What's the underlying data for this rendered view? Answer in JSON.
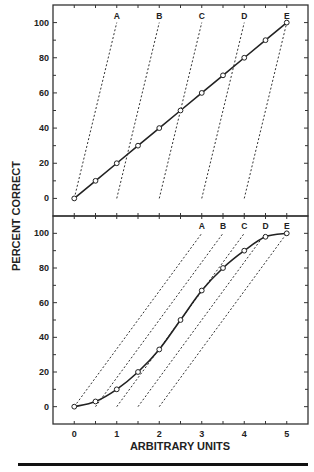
{
  "chart_data": [
    {
      "type": "line",
      "panel": "top",
      "title": "",
      "xlabel": "ARBITRARY UNITS",
      "ylabel": "PERCENT CORRECT",
      "xlim": [
        -0.5,
        5.5
      ],
      "ylim": [
        -10,
        110
      ],
      "x_ticks": [
        0,
        0.5,
        1,
        1.5,
        2,
        2.5,
        3,
        3.5,
        4,
        4.5,
        5
      ],
      "y_ticks": [
        0,
        20,
        40,
        60,
        80,
        100
      ],
      "y_tick_labels": [
        "0",
        "20",
        "40",
        "60",
        "80",
        "100"
      ],
      "grid": false,
      "series": [
        {
          "name": "observed",
          "style": "solid-with-circles",
          "x": [
            0,
            0.5,
            1,
            1.5,
            2,
            2.5,
            3,
            3.5,
            4,
            4.5,
            5
          ],
          "y": [
            0,
            10,
            20,
            30,
            40,
            50,
            60,
            70,
            80,
            90,
            100
          ]
        }
      ],
      "dashed_lines": [
        {
          "label": "A",
          "from": [
            0,
            0
          ],
          "to": [
            1,
            100
          ]
        },
        {
          "label": "B",
          "from": [
            1,
            0
          ],
          "to": [
            2,
            100
          ]
        },
        {
          "label": "C",
          "from": [
            2,
            0
          ],
          "to": [
            3,
            100
          ]
        },
        {
          "label": "D",
          "from": [
            3,
            0
          ],
          "to": [
            4,
            100
          ]
        },
        {
          "label": "E",
          "from": [
            4,
            0
          ],
          "to": [
            5,
            100
          ]
        }
      ]
    },
    {
      "type": "line",
      "panel": "bottom",
      "title": "",
      "xlabel": "ARBITRARY UNITS",
      "ylabel": "PERCENT CORRECT",
      "xlim": [
        -0.5,
        5.5
      ],
      "ylim": [
        -10,
        110
      ],
      "x_ticks": [
        0,
        0.5,
        1,
        1.5,
        2,
        2.5,
        3,
        3.5,
        4,
        4.5,
        5
      ],
      "x_tick_labels": [
        "0",
        "1",
        "2",
        "3",
        "4",
        "5"
      ],
      "x_tick_label_values": [
        0,
        1,
        2,
        3,
        4,
        5
      ],
      "y_ticks": [
        0,
        20,
        40,
        60,
        80,
        100
      ],
      "y_tick_labels": [
        "0",
        "20",
        "40",
        "60",
        "80",
        "100"
      ],
      "grid": false,
      "series": [
        {
          "name": "observed",
          "style": "smooth-with-circles",
          "x": [
            0,
            0.5,
            1,
            1.5,
            2,
            2.5,
            3,
            3.5,
            4,
            4.5,
            5
          ],
          "y": [
            0,
            3,
            10,
            20,
            33,
            50,
            67,
            80,
            90,
            98,
            100
          ]
        }
      ],
      "dashed_lines": [
        {
          "label": "A",
          "from": [
            0,
            0
          ],
          "to": [
            3,
            100
          ]
        },
        {
          "label": "B",
          "from": [
            0.5,
            0
          ],
          "to": [
            3.5,
            100
          ]
        },
        {
          "label": "C",
          "from": [
            1,
            0
          ],
          "to": [
            4,
            100
          ]
        },
        {
          "label": "D",
          "from": [
            1.5,
            0
          ],
          "to": [
            4.5,
            100
          ]
        },
        {
          "label": "E",
          "from": [
            2,
            0
          ],
          "to": [
            5,
            100
          ]
        }
      ]
    }
  ]
}
